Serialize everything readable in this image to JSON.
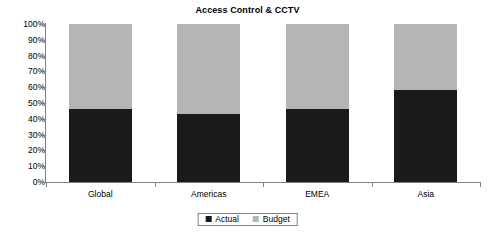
{
  "chart_data": {
    "type": "bar",
    "subtype": "stacked-100-percent",
    "title": "Access Control & CCTV",
    "xlabel": "",
    "ylabel": "",
    "categories": [
      "Global",
      "Americas",
      "EMEA",
      "Asia"
    ],
    "series": [
      {
        "name": "Actual",
        "color": "#1a1a1a",
        "values": [
          46,
          43,
          46,
          58
        ]
      },
      {
        "name": "Budget",
        "color": "#b5b5b5",
        "values": [
          54,
          57,
          54,
          42
        ]
      }
    ],
    "ylim": [
      0,
      100
    ],
    "ytick_values": [
      0,
      10,
      20,
      30,
      40,
      50,
      60,
      70,
      80,
      90,
      100
    ],
    "ytick_labels": [
      "0%",
      "10%",
      "20%",
      "30%",
      "40%",
      "50%",
      "60%",
      "70%",
      "80%",
      "90%",
      "100%"
    ],
    "grid": false,
    "legend_position": "bottom",
    "legend_entries": [
      "Actual",
      "Budget"
    ]
  },
  "colors": {
    "actual": "#1a1a1a",
    "budget": "#b5b5b5",
    "axis": "#808080",
    "text": "#000000",
    "background": "#ffffff"
  }
}
